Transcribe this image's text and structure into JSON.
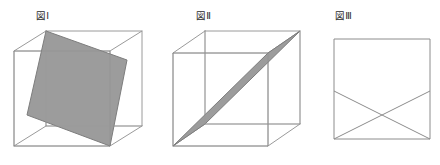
{
  "page": {
    "background_color": "#ffffff",
    "width": 440,
    "height": 165
  },
  "figures": [
    {
      "id": "figure-1",
      "label": "図Ⅰ",
      "shape": "cube",
      "section_shape": "rectangle",
      "description": "立方体を斜めに切った長方形の断面",
      "colors": {
        "edge": "#9a9a9a",
        "section_fill": "#9c9c9c",
        "section_stroke": "#7d7d7d"
      },
      "cube": {
        "front_top_left": [
          14,
          51
        ],
        "front_top_right": [
          110,
          51
        ],
        "front_bottom_right": [
          110,
          146
        ],
        "front_bottom_left": [
          14,
          146
        ],
        "back_top_left": [
          46,
          31
        ],
        "back_top_right": [
          142,
          31
        ],
        "back_bottom_right": [
          142,
          126
        ],
        "back_bottom_left": [
          46,
          126
        ]
      },
      "section_points": [
        [
          46,
          31
        ],
        [
          127,
          60
        ],
        [
          110,
          146
        ],
        [
          27,
          115
        ]
      ]
    },
    {
      "id": "figure-2",
      "label": "図Ⅱ",
      "shape": "cube",
      "section_shape": "parallelogram",
      "description": "立方体の対角を通る平行四辺形の断面",
      "colors": {
        "edge": "#9a9a9a",
        "section_fill": "#9c9c9c",
        "section_stroke": "#7d7d7d"
      },
      "cube": {
        "front_top_left": [
          173,
          53
        ],
        "front_top_right": [
          268,
          53
        ],
        "front_bottom_right": [
          268,
          146
        ],
        "front_bottom_left": [
          173,
          146
        ],
        "back_top_left": [
          205,
          31
        ],
        "back_top_right": [
          300,
          31
        ],
        "back_bottom_right": [
          300,
          124
        ],
        "back_bottom_left": [
          205,
          124
        ]
      },
      "section_points": [
        [
          173,
          146
        ],
        [
          205,
          124
        ],
        [
          300,
          31
        ],
        [
          268,
          53
        ]
      ]
    },
    {
      "id": "figure-3",
      "label": "図Ⅲ",
      "shape": "square",
      "section_shape": "crossed-lines",
      "description": "正方形に交差する2本の線",
      "colors": {
        "edge": "#8c8c8c"
      },
      "square": {
        "top_left": [
          334,
          39
        ],
        "top_right": [
          430,
          39
        ],
        "bottom_right": [
          430,
          139
        ],
        "bottom_left": [
          334,
          139
        ]
      },
      "lines": [
        {
          "from": [
            334,
            91
          ],
          "to": [
            430,
            139
          ]
        },
        {
          "from": [
            334,
            139
          ],
          "to": [
            430,
            91
          ]
        }
      ]
    }
  ]
}
